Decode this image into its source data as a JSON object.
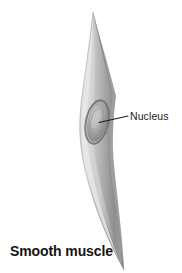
{
  "figure": {
    "caption": "Smooth muscle",
    "background_color": "#ffffff",
    "width": 182,
    "height": 273
  },
  "labels": [
    {
      "id": "nucleus",
      "text": "Nucleus",
      "color": "#1b1b1b",
      "leader_line": {
        "from_x": 99,
        "from_y": 122,
        "to_x": 128,
        "to_y": 116,
        "color": "#1b1b1b"
      }
    }
  ],
  "illustration": {
    "subject": "smooth muscle cell",
    "shape": "elongated spindle (fusiform) cell tapering to fine points at both ends",
    "top_tip": {
      "x": 93,
      "y": 12
    },
    "bottom_tip": {
      "x": 124,
      "y": 270
    },
    "widest_span": {
      "y": 125,
      "left_x": 79,
      "right_x": 113
    },
    "colors": {
      "cell_highlight": "#e2e2e2",
      "cell_mid": "#b4b4b4",
      "cell_shadow": "#8c8c8c",
      "cell_dark_edge": "#6e6e6e",
      "nucleus_ring": "#6f6f6f",
      "nucleus_fill": "#a9a9a9",
      "nucleus_highlight": "#c4c4c4"
    },
    "nucleus": {
      "center_x": 97,
      "center_y": 122,
      "radius_x": 10,
      "radius_y": 21,
      "rotation_deg": 12
    }
  }
}
